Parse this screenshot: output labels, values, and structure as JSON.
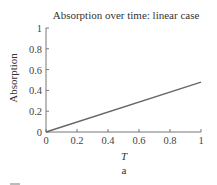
{
  "chart_data": {
    "type": "line",
    "title": "Absorption over time: linear case",
    "xlabel": "T",
    "ylabel": "Absorption",
    "subfigure_label": "a",
    "xlim": [
      0,
      1
    ],
    "ylim": [
      0,
      1
    ],
    "x_ticks": [
      0,
      0.2,
      0.4,
      0.6,
      0.8,
      1
    ],
    "x_tick_labels": [
      "0",
      "0.2",
      "0.4",
      "0.6",
      "0.8",
      "1"
    ],
    "y_ticks": [
      0,
      0.2,
      0.4,
      0.6,
      0.8,
      1
    ],
    "y_tick_labels": [
      "0",
      "0.2",
      "0.4",
      "0.6",
      "0.8",
      "1"
    ],
    "grid": false,
    "legend": null,
    "series": [
      {
        "name": "Absorption",
        "color": "#666666",
        "x": [
          0,
          1
        ],
        "y": [
          0,
          0.48
        ]
      }
    ]
  },
  "layout": {
    "plot": {
      "x0": 46,
      "y0": 132,
      "x1": 201,
      "y1": 28
    }
  }
}
